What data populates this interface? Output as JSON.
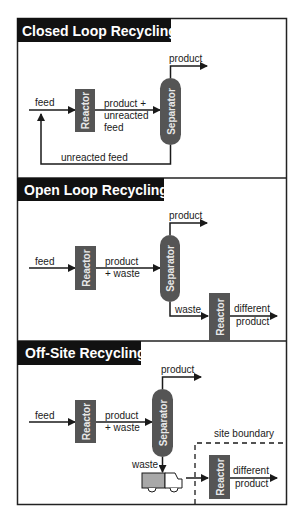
{
  "colors": {
    "frame": "#222222",
    "title_bg": "#111111",
    "unit_fill": "#555555",
    "line": "#1a1a1a",
    "truck_cargo": "#a8a8a8"
  },
  "panels": [
    {
      "title": "Closed Loop Recycling",
      "labels": {
        "feed": "feed",
        "reactor": "Reactor",
        "mid_line1": "product +",
        "mid_line2": "unreacted",
        "mid_line3": "feed",
        "separator": "Separator",
        "product": "product",
        "recycle": "unreacted feed"
      }
    },
    {
      "title": "Open Loop Recycling",
      "labels": {
        "feed": "feed",
        "reactor": "Reactor",
        "mid_line1": "product",
        "mid_line2": "+ waste",
        "separator": "Separator",
        "product": "product",
        "waste": "waste",
        "reactor2": "Reactor",
        "out_line1": "different",
        "out_line2": "product"
      }
    },
    {
      "title": "Off-Site Recycling",
      "labels": {
        "feed": "feed",
        "reactor": "Reactor",
        "mid_line1": "product",
        "mid_line2": "+ waste",
        "separator": "Separator",
        "product": "product",
        "waste": "waste",
        "site_boundary": "site boundary",
        "reactor2": "Reactor",
        "out_line1": "different",
        "out_line2": "product"
      }
    }
  ]
}
